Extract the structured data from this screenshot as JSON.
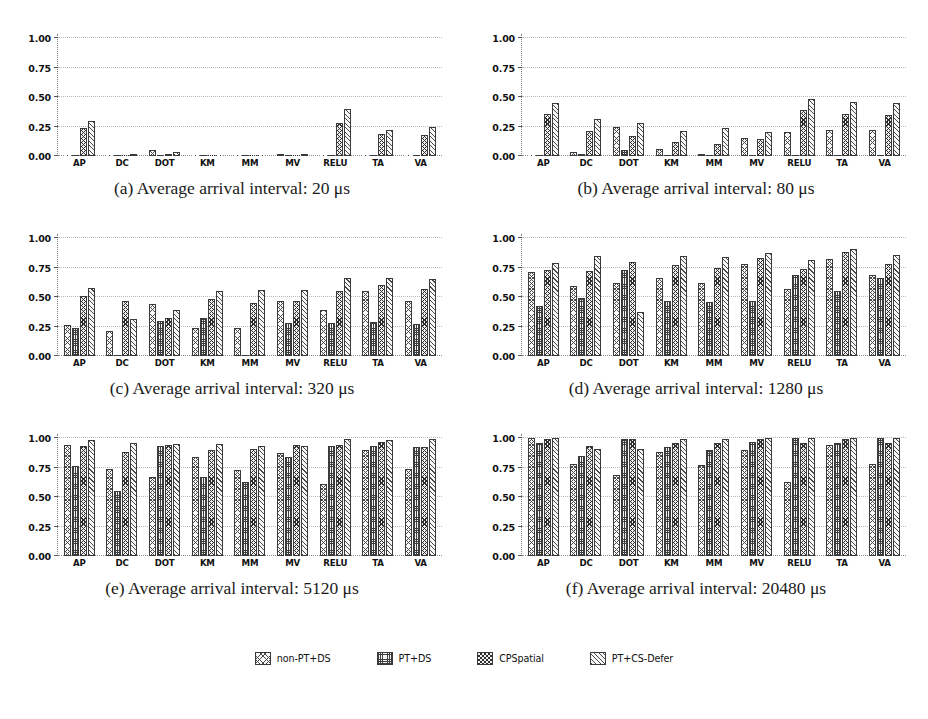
{
  "figure": {
    "y_ticks": [
      "0.00",
      "0.25",
      "0.50",
      "0.75",
      "1.00"
    ],
    "ylim": [
      0,
      1.0
    ],
    "categories": [
      "AP",
      "DC",
      "DOT",
      "KM",
      "MM",
      "MV",
      "RELU",
      "TA",
      "VA"
    ],
    "series_names": [
      "non-PT+DS",
      "PT+DS",
      "CPSpatial",
      "PT+CS-Defer"
    ]
  },
  "legend": {
    "position": "bottom-center",
    "items": [
      {
        "label": "non-PT+DS",
        "hatch": "h0"
      },
      {
        "label": "PT+DS",
        "hatch": "h1"
      },
      {
        "label": "CPSpatial",
        "hatch": "h2"
      },
      {
        "label": "PT+CS-Defer",
        "hatch": "h3"
      }
    ]
  },
  "panels": [
    {
      "tag": "(a)",
      "caption": "(a) Average arrival interval: 20 μs",
      "interval": "20"
    },
    {
      "tag": "(b)",
      "caption": "(b) Average arrival interval: 80 μs",
      "interval": "80"
    },
    {
      "tag": "(c)",
      "caption": "(c) Average arrival interval: 320 μs",
      "interval": "320"
    },
    {
      "tag": "(d)",
      "caption": "(d) Average arrival interval: 1280 μs",
      "interval": "1280"
    },
    {
      "tag": "(e)",
      "caption": "(e) Average arrival interval: 5120 μs",
      "interval": "5120"
    },
    {
      "tag": "(f)",
      "caption": "(f) Average arrival interval: 20480 μs",
      "interval": "20480"
    }
  ],
  "chart_data": [
    {
      "type": "bar",
      "title": "(a) Average arrival interval: 20 μs",
      "xlabel": "",
      "ylabel": "",
      "ylim": [
        0,
        1.0
      ],
      "yticks": [
        0.0,
        0.25,
        0.5,
        0.75,
        1.0
      ],
      "grid": true,
      "categories": [
        "AP",
        "DC",
        "DOT",
        "KM",
        "MM",
        "MV",
        "RELU",
        "TA",
        "VA"
      ],
      "series": [
        {
          "name": "non-PT+DS",
          "values": [
            0.0,
            0.0,
            0.05,
            0.0,
            0.0,
            0.02,
            0.0,
            0.0,
            0.0
          ]
        },
        {
          "name": "PT+DS",
          "values": [
            0.0,
            0.0,
            0.0,
            0.0,
            0.0,
            0.0,
            0.0,
            0.0,
            0.0
          ]
        },
        {
          "name": "CPSpatial",
          "values": [
            0.24,
            0.0,
            0.02,
            0.0,
            0.0,
            0.0,
            0.28,
            0.19,
            0.18
          ]
        },
        {
          "name": "PT+CS-Defer",
          "values": [
            0.3,
            0.02,
            0.03,
            0.0,
            0.0,
            0.01,
            0.4,
            0.22,
            0.25
          ]
        }
      ]
    },
    {
      "type": "bar",
      "title": "(b) Average arrival interval: 80 μs",
      "xlabel": "",
      "ylabel": "",
      "ylim": [
        0,
        1.0
      ],
      "yticks": [
        0.0,
        0.25,
        0.5,
        0.75,
        1.0
      ],
      "grid": true,
      "categories": [
        "AP",
        "DC",
        "DOT",
        "KM",
        "MM",
        "MV",
        "RELU",
        "TA",
        "VA"
      ],
      "series": [
        {
          "name": "non-PT+DS",
          "values": [
            0.0,
            0.03,
            0.25,
            0.06,
            0.02,
            0.15,
            0.2,
            0.22,
            0.22
          ]
        },
        {
          "name": "PT+DS",
          "values": [
            0.0,
            0.02,
            0.05,
            0.0,
            0.0,
            0.0,
            0.0,
            0.0,
            0.0
          ]
        },
        {
          "name": "CPSpatial",
          "values": [
            0.36,
            0.21,
            0.17,
            0.12,
            0.1,
            0.14,
            0.39,
            0.36,
            0.35
          ]
        },
        {
          "name": "PT+CS-Defer",
          "values": [
            0.45,
            0.31,
            0.28,
            0.21,
            0.24,
            0.2,
            0.48,
            0.46,
            0.45
          ]
        }
      ]
    },
    {
      "type": "bar",
      "title": "(c) Average arrival interval: 320 μs",
      "xlabel": "",
      "ylabel": "",
      "ylim": [
        0,
        1.0
      ],
      "yticks": [
        0.0,
        0.25,
        0.5,
        0.75,
        1.0
      ],
      "grid": true,
      "categories": [
        "AP",
        "DC",
        "DOT",
        "KM",
        "MM",
        "MV",
        "RELU",
        "TA",
        "VA"
      ],
      "series": [
        {
          "name": "non-PT+DS",
          "values": [
            0.26,
            0.21,
            0.44,
            0.24,
            0.24,
            0.47,
            0.39,
            0.55,
            0.47
          ]
        },
        {
          "name": "PT+DS",
          "values": [
            0.24,
            0.0,
            0.3,
            0.32,
            0.0,
            0.28,
            0.28,
            0.29,
            0.27
          ]
        },
        {
          "name": "CPSpatial",
          "values": [
            0.51,
            0.47,
            0.32,
            0.48,
            0.45,
            0.47,
            0.55,
            0.6,
            0.57
          ]
        },
        {
          "name": "PT+CS-Defer",
          "values": [
            0.58,
            0.31,
            0.39,
            0.55,
            0.56,
            0.56,
            0.66,
            0.66,
            0.65
          ]
        }
      ]
    },
    {
      "type": "bar",
      "title": "(d) Average arrival interval: 1280 μs",
      "xlabel": "",
      "ylabel": "",
      "ylim": [
        0,
        1.0
      ],
      "yticks": [
        0.0,
        0.25,
        0.5,
        0.75,
        1.0
      ],
      "grid": true,
      "categories": [
        "AP",
        "DC",
        "DOT",
        "KM",
        "MM",
        "MV",
        "RELU",
        "TA",
        "VA"
      ],
      "series": [
        {
          "name": "non-PT+DS",
          "values": [
            0.71,
            0.59,
            0.62,
            0.66,
            0.62,
            0.78,
            0.57,
            0.82,
            0.69
          ]
        },
        {
          "name": "PT+DS",
          "values": [
            0.42,
            0.49,
            0.73,
            0.47,
            0.46,
            0.47,
            0.69,
            0.55,
            0.66
          ]
        },
        {
          "name": "CPSpatial",
          "values": [
            0.73,
            0.72,
            0.8,
            0.77,
            0.75,
            0.83,
            0.74,
            0.88,
            0.78
          ]
        },
        {
          "name": "PT+CS-Defer",
          "values": [
            0.79,
            0.85,
            0.37,
            0.85,
            0.84,
            0.87,
            0.81,
            0.91,
            0.86
          ]
        }
      ]
    },
    {
      "type": "bar",
      "title": "(e) Average arrival interval: 5120 μs",
      "xlabel": "",
      "ylabel": "",
      "ylim": [
        0,
        1.0
      ],
      "yticks": [
        0.0,
        0.25,
        0.5,
        0.75,
        1.0
      ],
      "grid": true,
      "categories": [
        "AP",
        "DC",
        "DOT",
        "KM",
        "MM",
        "MV",
        "RELU",
        "TA",
        "VA"
      ],
      "series": [
        {
          "name": "non-PT+DS",
          "values": [
            0.94,
            0.74,
            0.67,
            0.84,
            0.73,
            0.87,
            0.61,
            0.9,
            0.74
          ]
        },
        {
          "name": "PT+DS",
          "values": [
            0.76,
            0.55,
            0.93,
            0.67,
            0.63,
            0.84,
            0.93,
            0.93,
            0.92
          ]
        },
        {
          "name": "CPSpatial",
          "values": [
            0.93,
            0.88,
            0.94,
            0.9,
            0.91,
            0.94,
            0.94,
            0.97,
            0.92
          ]
        },
        {
          "name": "PT+CS-Defer",
          "values": [
            0.98,
            0.96,
            0.95,
            0.95,
            0.93,
            0.93,
            0.99,
            0.98,
            0.99
          ]
        }
      ]
    },
    {
      "type": "bar",
      "title": "(f) Average arrival interval: 20480 μs",
      "xlabel": "",
      "ylabel": "",
      "ylim": [
        0,
        1.0
      ],
      "yticks": [
        0.0,
        0.25,
        0.5,
        0.75,
        1.0
      ],
      "grid": true,
      "categories": [
        "AP",
        "DC",
        "DOT",
        "KM",
        "MM",
        "MV",
        "RELU",
        "TA",
        "VA"
      ],
      "series": [
        {
          "name": "non-PT+DS",
          "values": [
            1.0,
            0.78,
            0.69,
            0.88,
            0.77,
            0.9,
            0.63,
            0.94,
            0.78
          ]
        },
        {
          "name": "PT+DS",
          "values": [
            0.96,
            0.85,
            0.99,
            0.92,
            0.9,
            0.97,
            1.0,
            0.96,
            1.0
          ]
        },
        {
          "name": "CPSpatial",
          "values": [
            0.99,
            0.93,
            0.99,
            0.96,
            0.96,
            0.99,
            0.96,
            0.99,
            0.96
          ]
        },
        {
          "name": "PT+CS-Defer",
          "values": [
            1.0,
            0.91,
            0.91,
            0.99,
            0.99,
            1.0,
            1.0,
            1.0,
            1.0
          ]
        }
      ]
    }
  ]
}
